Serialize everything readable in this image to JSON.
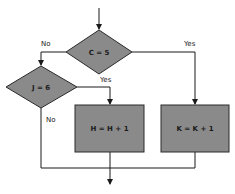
{
  "diagram": {
    "type": "flowchart",
    "colors": {
      "shape_fill": "#8a8a8a",
      "shape_stroke": "#2a2a2a",
      "line": "#1a1a1a",
      "background": "#ffffff"
    },
    "nodes": [
      {
        "id": "decision-c",
        "shape": "diamond",
        "label": "C = 5"
      },
      {
        "id": "decision-j",
        "shape": "diamond",
        "label": "J = 6"
      },
      {
        "id": "process-h",
        "shape": "rectangle",
        "label": "H = H + 1"
      },
      {
        "id": "process-k",
        "shape": "rectangle",
        "label": "K = K + 1"
      }
    ],
    "edges": [
      {
        "from": "entry",
        "to": "decision-c",
        "label": ""
      },
      {
        "from": "decision-c",
        "to": "decision-j",
        "label": "No"
      },
      {
        "from": "decision-c",
        "to": "process-k",
        "label": "Yes"
      },
      {
        "from": "decision-j",
        "to": "process-h",
        "label": "Yes"
      },
      {
        "from": "decision-j",
        "to": "exit",
        "label": "No"
      },
      {
        "from": "process-h",
        "to": "exit",
        "label": ""
      },
      {
        "from": "process-k",
        "to": "exit",
        "label": ""
      }
    ],
    "labels": {
      "c_no": "No",
      "c_yes": "Yes",
      "j_yes": "Yes",
      "j_no": "No"
    }
  }
}
